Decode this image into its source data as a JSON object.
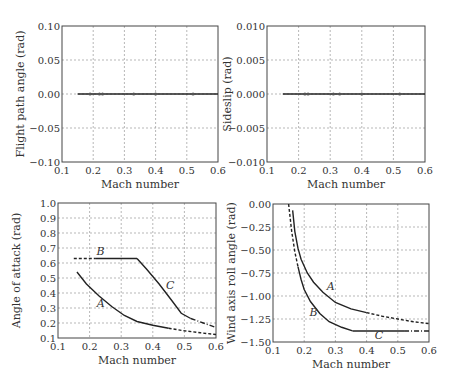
{
  "chart_data": [
    {
      "type": "line",
      "title": "",
      "xlabel": "Mach number",
      "ylabel": "Flight path angle (rad)",
      "xlim": [
        0.1,
        0.6
      ],
      "ylim": [
        -0.1,
        0.1
      ],
      "xticks": [
        "0.1",
        "0.2",
        "0.3",
        "0.4",
        "0.5",
        "0.6"
      ],
      "yticks": [
        "0.10",
        "0.05",
        "0.00",
        "−0.05",
        "−0.10"
      ],
      "grid": true,
      "series": [
        {
          "name": "trim",
          "style": "solid",
          "x": [
            0.15,
            0.6
          ],
          "y": [
            0.0,
            0.0
          ]
        }
      ],
      "markers_x": [
        0.19,
        0.22,
        0.23,
        0.33,
        0.4,
        0.52
      ]
    },
    {
      "type": "line",
      "title": "",
      "xlabel": "Mach number",
      "ylabel": "Sideslip (rad)",
      "xlim": [
        0.1,
        0.6
      ],
      "ylim": [
        -0.01,
        0.01
      ],
      "xticks": [
        "0.1",
        "0.2",
        "0.3",
        "0.4",
        "0.5",
        "0.6"
      ],
      "yticks": [
        "0.010",
        "0.005",
        "0.000",
        "−0.005",
        "−0.010"
      ],
      "grid": true,
      "series": [
        {
          "name": "trim",
          "style": "solid",
          "x": [
            0.15,
            0.6
          ],
          "y": [
            0.0,
            0.0
          ]
        }
      ],
      "markers_x": [
        0.22,
        0.23,
        0.31,
        0.33,
        0.4,
        0.52
      ]
    },
    {
      "type": "line",
      "title": "",
      "xlabel": "Mach number",
      "ylabel": "Angle of attack (rad)",
      "xlim": [
        0.1,
        0.6
      ],
      "ylim": [
        0.1,
        1.0
      ],
      "xticks": [
        "0.1",
        "0.2",
        "0.3",
        "0.4",
        "0.5",
        "0.6"
      ],
      "yticks": [
        "1.0",
        "0.9",
        "0.8",
        "0.7",
        "0.6",
        "0.5",
        "0.4",
        "0.3",
        "0.2",
        "0.1"
      ],
      "grid": true,
      "series": [
        {
          "name": "A",
          "style": "solid-dashed",
          "x": [
            0.16,
            0.19,
            0.23,
            0.27,
            0.31,
            0.35,
            0.4,
            0.45,
            0.5,
            0.55,
            0.6
          ],
          "y": [
            0.54,
            0.46,
            0.38,
            0.31,
            0.25,
            0.21,
            0.185,
            0.165,
            0.148,
            0.135,
            0.123
          ]
        },
        {
          "name": "B",
          "style": "dashed-solid",
          "x": [
            0.15,
            0.22,
            0.24,
            0.35
          ],
          "y": [
            0.63,
            0.63,
            0.63,
            0.63
          ]
        },
        {
          "name": "C",
          "style": "solid-dashdot",
          "x": [
            0.35,
            0.38,
            0.42,
            0.46,
            0.49,
            0.52,
            0.56,
            0.6
          ],
          "y": [
            0.63,
            0.56,
            0.46,
            0.35,
            0.265,
            0.23,
            0.2,
            0.17
          ]
        }
      ],
      "annotations": [
        {
          "text": "A",
          "x": 0.235,
          "y": 0.31
        },
        {
          "text": "B",
          "x": 0.235,
          "y": 0.655
        },
        {
          "text": "C",
          "x": 0.455,
          "y": 0.43
        }
      ]
    },
    {
      "type": "line",
      "title": "",
      "xlabel": "Mach number",
      "ylabel": "Wind axis roll angle (rad)",
      "xlim": [
        0.1,
        0.6
      ],
      "ylim": [
        -1.5,
        0.0
      ],
      "xticks": [
        "0.1",
        "0.2",
        "0.3",
        "0.4",
        "0.5",
        "0.6"
      ],
      "yticks": [
        "0.00",
        "−0.25",
        "−0.50",
        "−0.75",
        "−1.00",
        "−1.25",
        "−1.50"
      ],
      "grid": true,
      "series": [
        {
          "name": "A",
          "style": "solid-dashed",
          "x": [
            0.163,
            0.17,
            0.18,
            0.19,
            0.21,
            0.23,
            0.26,
            0.3,
            0.35,
            0.4,
            0.45,
            0.5,
            0.55,
            0.6
          ],
          "y": [
            -0.07,
            -0.3,
            -0.48,
            -0.6,
            -0.75,
            -0.85,
            -0.96,
            -1.07,
            -1.14,
            -1.18,
            -1.22,
            -1.25,
            -1.28,
            -1.3
          ]
        },
        {
          "name": "B",
          "style": "dashed-solid",
          "x": [
            0.15,
            0.16,
            0.17,
            0.18,
            0.19,
            0.2,
            0.22,
            0.25,
            0.28,
            0.32,
            0.355
          ],
          "y": [
            0.0,
            -0.3,
            -0.52,
            -0.68,
            -0.82,
            -0.93,
            -1.06,
            -1.19,
            -1.28,
            -1.34,
            -1.38
          ]
        },
        {
          "name": "C",
          "style": "solid-dashdot",
          "x": [
            0.355,
            0.52,
            0.6
          ],
          "y": [
            -1.38,
            -1.38,
            -1.38
          ]
        }
      ],
      "annotations": [
        {
          "text": "A",
          "x": 0.285,
          "y": -0.93
        },
        {
          "text": "B",
          "x": 0.23,
          "y": -1.22
        },
        {
          "text": "C",
          "x": 0.44,
          "y": -1.47
        }
      ]
    }
  ],
  "figure": {
    "xlabel": "Mach number",
    "panels": [
      {
        "id": "p1",
        "ylabel": "Flight path angle (rad)"
      },
      {
        "id": "p2",
        "ylabel": "Sideslip (rad)"
      },
      {
        "id": "p3",
        "ylabel": "Angle of attack (rad)"
      },
      {
        "id": "p4",
        "ylabel": "Wind axis roll angle (rad)"
      }
    ]
  }
}
